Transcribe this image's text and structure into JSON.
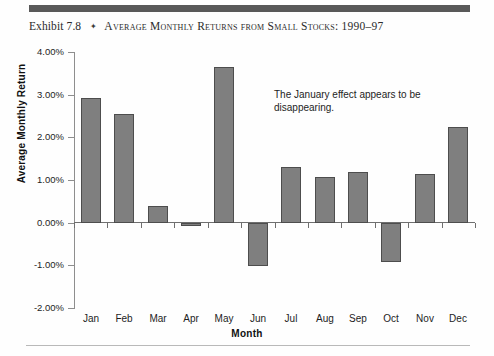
{
  "exhibit": {
    "number_label": "Exhibit 7.8",
    "separator_glyph": "✦",
    "title": "Average Monthly Returns from Small Stocks: 1990–97"
  },
  "annotation": {
    "text": "The January effect appears to be disappearing."
  },
  "colors": {
    "bar_fill": "#7f7f7f",
    "bar_border": "#4d4d4d",
    "top_rule": "#595959",
    "axis": "#6f6f6f",
    "text": "#1d1d1d"
  },
  "chart_data": {
    "type": "bar",
    "title": "Average Monthly Returns from Small Stocks: 1990–97",
    "xlabel": "Month",
    "ylabel": "Average Monthly Return",
    "categories": [
      "Jan",
      "Feb",
      "Mar",
      "Apr",
      "May",
      "Jun",
      "Jul",
      "Aug",
      "Sep",
      "Oct",
      "Nov",
      "Dec"
    ],
    "values": [
      2.92,
      2.55,
      0.39,
      -0.07,
      3.66,
      -1.02,
      1.3,
      1.08,
      1.19,
      -0.93,
      1.14,
      2.24
    ],
    "value_unit": "percent",
    "ylim": [
      -2.0,
      4.0
    ],
    "ytick_values": [
      4.0,
      3.0,
      2.0,
      1.0,
      0.0,
      -1.0,
      -2.0
    ],
    "ytick_labels": [
      "4.00%",
      "3.00%",
      "2.00%",
      "1.00%",
      "0.00%",
      "-1.00%",
      "-2.00%"
    ],
    "grid": false,
    "legend": false,
    "legend_position": "none",
    "annotations": [
      "The January effect appears to be disappearing."
    ]
  }
}
